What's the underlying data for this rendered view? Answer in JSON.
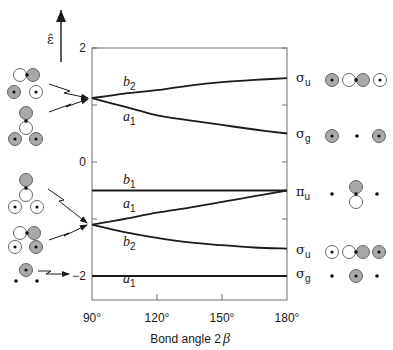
{
  "chart_data": {
    "type": "line",
    "title": "",
    "xlabel": "Bond angle 2β",
    "ylabel": "ε̂",
    "xlim": [
      90,
      180
    ],
    "ylim": [
      -2.45,
      2
    ],
    "x_ticks": [
      90,
      120,
      150,
      180
    ],
    "x_tick_labels": [
      "90°",
      "120°",
      "150°",
      "180°"
    ],
    "y_ticks": [
      2,
      1,
      0,
      -1,
      -2
    ],
    "y_tick_labels": {
      "2": "2",
      "0": "0",
      "-2": "−2"
    },
    "grid": false,
    "x": [
      90,
      105,
      120,
      135,
      150,
      165,
      180
    ],
    "series": [
      {
        "name": "b2 (upper)",
        "label_main": "b",
        "label_sub": "2",
        "right_label_main": "σ",
        "right_label_sub": "u",
        "values": [
          1.12,
          1.2,
          1.26,
          1.34,
          1.4,
          1.44,
          1.47
        ]
      },
      {
        "name": "a1 (upper)",
        "label_main": "a",
        "label_sub": "1",
        "right_label_main": "σ",
        "right_label_sub": "g",
        "values": [
          1.12,
          0.97,
          0.82,
          0.73,
          0.65,
          0.57,
          0.5
        ]
      },
      {
        "name": "b1",
        "label_main": "b",
        "label_sub": "1",
        "right_label_main": "π",
        "right_label_sub": "u",
        "values": [
          -0.5,
          -0.5,
          -0.5,
          -0.5,
          -0.5,
          -0.5,
          -0.5
        ]
      },
      {
        "name": "a1 (middle)",
        "label_main": "a",
        "label_sub": "1",
        "right_label_main": "",
        "right_label_sub": "",
        "values": [
          -1.1,
          -1.0,
          -0.89,
          -0.8,
          -0.7,
          -0.6,
          -0.5
        ]
      },
      {
        "name": "b2 (lower)",
        "label_main": "b",
        "label_sub": "2",
        "right_label_main": "σ",
        "right_label_sub": "u",
        "values": [
          -1.1,
          -1.23,
          -1.33,
          -1.41,
          -1.46,
          -1.5,
          -1.52
        ]
      },
      {
        "name": "a1 (lowest)",
        "label_main": "a",
        "label_sub": "1",
        "right_label_main": "σ",
        "right_label_sub": "g",
        "values": [
          -2,
          -2,
          -2,
          -2,
          -2,
          -2,
          -2
        ]
      }
    ],
    "level_label_positions": [
      [
        123,
        86
      ],
      [
        123,
        121
      ],
      [
        123,
        184
      ],
      [
        123,
        208
      ],
      [
        123,
        246
      ],
      [
        123,
        283
      ]
    ],
    "right_label_positions": [
      [
        296,
        82
      ],
      [
        296,
        138
      ],
      [
        296,
        196
      ],
      null,
      [
        296,
        254
      ],
      [
        296,
        278
      ]
    ]
  },
  "labels": {
    "epsilon": "ε̂",
    "xlabel_text": "Bond angle 2",
    "xlabel_symbol": "β"
  },
  "colors": {
    "line": "#1a1a1a",
    "axis": "#6f6f6f",
    "lobe_gray": "#a9a9a9",
    "lobe_white": "#ffffff"
  },
  "orbital_diagrams": {
    "left": [
      {
        "name": "b2-upper-90",
        "shapes": [
          {
            "t": "white",
            "x": 20,
            "y": 75
          },
          {
            "t": "gray",
            "x": 33,
            "y": 75
          },
          {
            "t": "dot",
            "x": 27,
            "y": 75
          },
          {
            "t": "gray-dot",
            "x": 14,
            "y": 92
          },
          {
            "t": "white-dot",
            "x": 36,
            "y": 92
          }
        ]
      },
      {
        "name": "a1-upper-90",
        "shapes": [
          {
            "t": "gray",
            "x": 26,
            "y": 113
          },
          {
            "t": "white",
            "x": 26,
            "y": 128
          },
          {
            "t": "dot",
            "x": 26,
            "y": 121
          },
          {
            "t": "gray-dot",
            "x": 15,
            "y": 139
          },
          {
            "t": "gray-dot",
            "x": 36,
            "y": 139
          }
        ]
      },
      {
        "name": "b1-90",
        "shapes": [
          {
            "t": "gray",
            "x": 26,
            "y": 180
          },
          {
            "t": "white",
            "x": 26,
            "y": 195
          },
          {
            "t": "dot",
            "x": 26,
            "y": 188
          },
          {
            "t": "white-dot",
            "x": 15,
            "y": 207
          },
          {
            "t": "white-dot",
            "x": 37,
            "y": 207
          }
        ]
      },
      {
        "name": "b2-lower-90",
        "shapes": [
          {
            "t": "white",
            "x": 20,
            "y": 233
          },
          {
            "t": "gray",
            "x": 34,
            "y": 233
          },
          {
            "t": "dot",
            "x": 27,
            "y": 233
          },
          {
            "t": "white-dot",
            "x": 15,
            "y": 247
          },
          {
            "t": "gray-dot",
            "x": 36,
            "y": 247
          }
        ]
      },
      {
        "name": "a1-lowest-90",
        "shapes": [
          {
            "t": "gray-dot",
            "x": 26,
            "y": 270
          },
          {
            "t": "dot",
            "x": 16,
            "y": 281
          },
          {
            "t": "dot",
            "x": 37,
            "y": 281
          }
        ]
      }
    ],
    "right": [
      {
        "name": "sigma-u-upper-180",
        "shapes": [
          {
            "t": "gray-dot",
            "x": 332,
            "y": 80
          },
          {
            "t": "white",
            "x": 349,
            "y": 80
          },
          {
            "t": "gray",
            "x": 363,
            "y": 80
          },
          {
            "t": "dot",
            "x": 356,
            "y": 80
          },
          {
            "t": "white-dot",
            "x": 380,
            "y": 80
          }
        ]
      },
      {
        "name": "sigma-g-upper-180",
        "shapes": [
          {
            "t": "gray-dot",
            "x": 332,
            "y": 136
          },
          {
            "t": "dot",
            "x": 357,
            "y": 136
          },
          {
            "t": "gray-dot",
            "x": 379,
            "y": 136
          }
        ]
      },
      {
        "name": "pi-u-180",
        "shapes": [
          {
            "t": "dot",
            "x": 332,
            "y": 194
          },
          {
            "t": "gray",
            "x": 356,
            "y": 187
          },
          {
            "t": "white",
            "x": 356,
            "y": 202
          },
          {
            "t": "dot",
            "x": 356,
            "y": 194
          },
          {
            "t": "dot",
            "x": 377,
            "y": 194
          }
        ]
      },
      {
        "name": "sigma-u-lower-180",
        "shapes": [
          {
            "t": "white-dot",
            "x": 332,
            "y": 252
          },
          {
            "t": "white",
            "x": 349,
            "y": 252
          },
          {
            "t": "gray",
            "x": 363,
            "y": 252
          },
          {
            "t": "dot",
            "x": 356,
            "y": 252
          },
          {
            "t": "gray-dot",
            "x": 379,
            "y": 252
          }
        ]
      },
      {
        "name": "sigma-g-lower-180",
        "shapes": [
          {
            "t": "dot",
            "x": 332,
            "y": 276
          },
          {
            "t": "gray-dot",
            "x": 356,
            "y": 276
          },
          {
            "t": "dot",
            "x": 377,
            "y": 276
          }
        ]
      }
    ]
  },
  "arrows": [
    {
      "name": "arrow-to-upper-degenerate-1",
      "points": [
        [
          49,
          84
        ],
        [
          70,
          91
        ],
        [
          64,
          93
        ],
        [
          88,
          98
        ]
      ]
    },
    {
      "name": "arrow-to-upper-degenerate-2",
      "points": [
        [
          49,
          112
        ],
        [
          71,
          104
        ],
        [
          66,
          107
        ],
        [
          88,
          99
        ]
      ]
    },
    {
      "name": "arrow-to-lower-degenerate-1",
      "points": [
        [
          48,
          189
        ],
        [
          64,
          200
        ],
        [
          59,
          201
        ],
        [
          87,
          223
        ]
      ]
    },
    {
      "name": "arrow-to-lower-degenerate-2",
      "points": [
        [
          49,
          240
        ],
        [
          69,
          233
        ],
        [
          64,
          236
        ],
        [
          87,
          225
        ]
      ]
    },
    {
      "name": "arrow-to-minus-two",
      "points": [
        [
          38,
          271
        ],
        [
          51,
          271
        ],
        [
          46,
          274
        ],
        [
          69,
          274
        ]
      ]
    }
  ]
}
